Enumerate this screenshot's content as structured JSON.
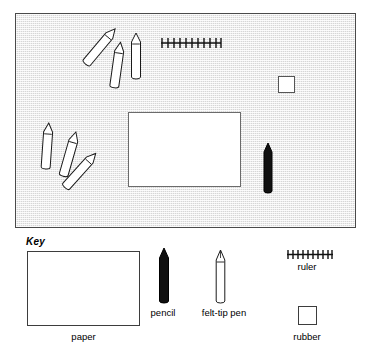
{
  "diagram": {
    "title": "",
    "scene": {
      "name": "desk-surface",
      "background_color": "#d6d6d6",
      "border_color": "#4a4a4a",
      "items": [
        {
          "id": "pencil-top-1",
          "type": "felt-tip pen",
          "color": "#ffffff",
          "x": 93,
          "y": 26,
          "rotation": 40
        },
        {
          "id": "pencil-top-2",
          "type": "felt-tip pen",
          "color": "#ffffff",
          "x": 110,
          "y": 44,
          "rotation": 8
        },
        {
          "id": "pencil-top-3",
          "type": "felt-tip pen",
          "color": "#ffffff",
          "x": 127,
          "y": 34,
          "rotation": 0
        },
        {
          "id": "pencil-bot-1",
          "type": "felt-tip pen",
          "color": "#ffffff",
          "x": 38,
          "y": 124,
          "rotation": 4
        },
        {
          "id": "pencil-bot-2",
          "type": "felt-tip pen",
          "color": "#ffffff",
          "x": 60,
          "y": 132,
          "rotation": 16
        },
        {
          "id": "pencil-bot-3",
          "type": "felt-tip pen",
          "color": "#ffffff",
          "x": 70,
          "y": 148,
          "rotation": 42
        },
        {
          "id": "pencil-black",
          "type": "pencil",
          "color": "#0d0d0d",
          "x": 262,
          "y": 141,
          "rotation": 0
        },
        {
          "id": "paper-sheet",
          "type": "paper",
          "color": "#ffffff",
          "x": 127,
          "y": 111
        },
        {
          "id": "rubber-square",
          "type": "rubber",
          "color": "#ffffff",
          "x": 277,
          "y": 75
        },
        {
          "id": "ruler-strip",
          "type": "ruler",
          "color": "#000000",
          "x": 160,
          "y": 38,
          "ticks": 11
        }
      ]
    }
  },
  "key": {
    "title": "Key",
    "items": [
      {
        "id": "paper",
        "label": "paper",
        "symbol": "paper-rectangle-icon",
        "color": "#ffffff"
      },
      {
        "id": "pencil",
        "label": "pencil",
        "symbol": "pencil-icon",
        "color": "#0d0d0d"
      },
      {
        "id": "felt-tip-pen",
        "label": "felt-tip pen",
        "symbol": "felt-tip-pen-icon",
        "color": "#ffffff"
      },
      {
        "id": "ruler",
        "label": "ruler",
        "symbol": "ruler-icon",
        "color": "#000000",
        "ticks": 10
      },
      {
        "id": "rubber",
        "label": "rubber",
        "symbol": "rubber-square-icon",
        "color": "#ffffff"
      }
    ]
  }
}
